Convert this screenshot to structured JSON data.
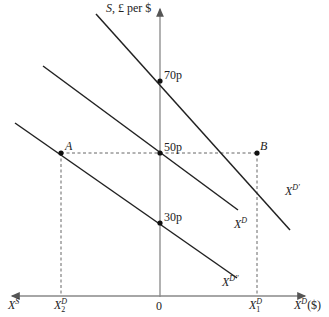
{
  "diagram": {
    "y_axis_label": "S, £ per $",
    "y_axis_label_parts": {
      "var": "S",
      "rest": ", £ per $"
    },
    "x_axis_label": {
      "base": "X",
      "sup": "D",
      "suffix": "($)"
    },
    "x_axis_left_label": {
      "base": "X",
      "sup": "S"
    },
    "origin_label": "0",
    "price_levels": [
      "70p",
      "50p",
      "30p"
    ],
    "points": [
      {
        "name": "A",
        "label": "A"
      },
      {
        "name": "B",
        "label": "B"
      }
    ],
    "curves": [
      {
        "name": "X^D'",
        "base": "X",
        "sup": "D'"
      },
      {
        "name": "X^D",
        "base": "X",
        "sup": "D"
      },
      {
        "name": "X^D''",
        "base": "X",
        "sup": "D''"
      }
    ],
    "x_ticks": [
      {
        "base": "X",
        "sup": "D",
        "sub": "2"
      },
      {
        "base": "X",
        "sup": "D",
        "sub": "1"
      }
    ],
    "colors": {
      "line": "#222222",
      "axis": "#888888",
      "dash": "#555555"
    }
  }
}
